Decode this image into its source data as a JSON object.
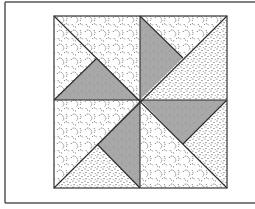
{
  "figure": {
    "title": "Pinwheel quilt block",
    "type": "quilt-block-diagram",
    "frame": {
      "left": 5,
      "top": 2,
      "bottom": 203,
      "right": 255,
      "stroke": "#555555"
    },
    "block": {
      "x": 54,
      "y": 16,
      "width": 173,
      "height": 172,
      "center_x": 140,
      "center_y": 100,
      "stroke": "#333333"
    },
    "colors": {
      "background": "#ffffff",
      "gray_fill": "#a8a8a8",
      "pattern_ink": "#444444",
      "line": "#2a2a2a"
    },
    "pieces": [
      {
        "name": "top-left-left-triangle",
        "fabric": "swirl",
        "points": "54,16 54,100 97,58"
      },
      {
        "name": "top-left-top-triangle",
        "fabric": "swirl",
        "points": "54,16 140,16 140,100 97,58"
      },
      {
        "name": "top-left-gray-triangle",
        "fabric": "gray",
        "points": "54,100 140,100 97,58"
      },
      {
        "name": "top-right-gray-triangle",
        "fabric": "gray",
        "points": "140,16 140,100 183,58"
      },
      {
        "name": "top-right-top-triangle",
        "fabric": "swirl",
        "points": "140,16 227,16 183,58"
      },
      {
        "name": "top-right-right-triangle",
        "fabric": "dots",
        "points": "227,16 227,100 140,100 183,58"
      },
      {
        "name": "bottom-right-gray-triangle",
        "fabric": "gray",
        "points": "140,100 227,100 183,144"
      },
      {
        "name": "bottom-right-right-triangle",
        "fabric": "dots",
        "points": "227,100 227,188 183,144"
      },
      {
        "name": "bottom-right-bottom-triangle",
        "fabric": "swirl",
        "points": "140,100 183,144 227,188 140,188"
      },
      {
        "name": "bottom-left-gray-triangle",
        "fabric": "gray",
        "points": "140,100 140,188 97,144"
      },
      {
        "name": "bottom-left-bottom-triangle",
        "fabric": "dots",
        "points": "54,188 140,188 97,144"
      },
      {
        "name": "bottom-left-left-triangle",
        "fabric": "swirl",
        "points": "54,100 140,100 97,144 54,188"
      }
    ],
    "lines": [
      {
        "name": "diagonal-main",
        "x1": 54,
        "y1": 16,
        "x2": 227,
        "y2": 188
      },
      {
        "name": "diagonal-anti",
        "x1": 227,
        "y1": 16,
        "x2": 54,
        "y2": 188
      },
      {
        "name": "vertical-midline",
        "x1": 140,
        "y1": 16,
        "x2": 140,
        "y2": 188
      },
      {
        "name": "horizontal-midline",
        "x1": 54,
        "y1": 100,
        "x2": 227,
        "y2": 100
      },
      {
        "name": "gray-edge-tl",
        "x1": 54,
        "y1": 100,
        "x2": 97,
        "y2": 58
      },
      {
        "name": "gray-edge-tr",
        "x1": 140,
        "y1": 16,
        "x2": 183,
        "y2": 58
      },
      {
        "name": "gray-edge-br",
        "x1": 227,
        "y1": 100,
        "x2": 183,
        "y2": 144
      },
      {
        "name": "gray-edge-bl",
        "x1": 140,
        "y1": 188,
        "x2": 97,
        "y2": 144
      }
    ]
  }
}
